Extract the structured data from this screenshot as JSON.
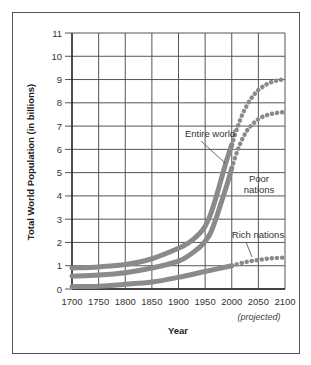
{
  "chart_data": {
    "type": "line",
    "title": "",
    "xlabel": "Year",
    "ylabel": "Total World Population (in billions)",
    "xlim": [
      1700,
      2100
    ],
    "ylim": [
      0,
      11
    ],
    "grid": true,
    "x_ticks": [
      "1700",
      "1750",
      "1800",
      "1850",
      "1900",
      "1950",
      "2000",
      "2050",
      "2100"
    ],
    "y_ticks": [
      "0",
      "1",
      "2",
      "3",
      "4",
      "5",
      "6",
      "7",
      "8",
      "9",
      "10",
      "11"
    ],
    "x_note": "(projected)",
    "projection_start": 2000,
    "series": [
      {
        "name": "Entire world",
        "x": [
          1700,
          1750,
          1800,
          1850,
          1900,
          1920,
          1940,
          1950,
          1960,
          1970,
          1980,
          1990,
          2000,
          2010,
          2020,
          2030,
          2040,
          2050,
          2060,
          2070,
          2080,
          2090,
          2100
        ],
        "values": [
          0.9,
          0.95,
          1.05,
          1.3,
          1.75,
          2.0,
          2.4,
          2.7,
          3.2,
          3.9,
          4.7,
          5.5,
          6.2,
          6.9,
          7.5,
          7.95,
          8.3,
          8.55,
          8.72,
          8.85,
          8.93,
          8.98,
          9.0
        ]
      },
      {
        "name": "Poor nations",
        "x": [
          1700,
          1750,
          1800,
          1850,
          1900,
          1920,
          1940,
          1950,
          1960,
          1970,
          1980,
          1990,
          2000,
          2010,
          2020,
          2030,
          2040,
          2050,
          2060,
          2070,
          2080,
          2090,
          2100
        ],
        "values": [
          0.55,
          0.6,
          0.7,
          0.9,
          1.2,
          1.45,
          1.8,
          2.05,
          2.4,
          3.0,
          3.7,
          4.4,
          5.2,
          5.9,
          6.45,
          6.85,
          7.1,
          7.3,
          7.42,
          7.5,
          7.55,
          7.58,
          7.6
        ]
      },
      {
        "name": "Rich nations",
        "x": [
          1700,
          1750,
          1800,
          1850,
          1900,
          1950,
          2000,
          2025,
          2050,
          2075,
          2100
        ],
        "values": [
          0.1,
          0.12,
          0.2,
          0.3,
          0.5,
          0.75,
          1.0,
          1.15,
          1.25,
          1.32,
          1.35
        ]
      }
    ],
    "annotations": [
      {
        "text": "Entire world"
      },
      {
        "text": "Poor"
      },
      {
        "text": "nations"
      },
      {
        "text": "Rich nations"
      }
    ]
  }
}
